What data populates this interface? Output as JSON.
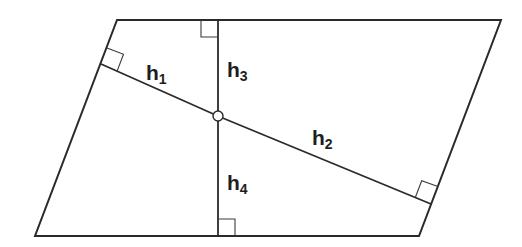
{
  "diagram": {
    "type": "geometry",
    "shape": "parallelogram",
    "vertices": {
      "top_left": [
        117,
        20
      ],
      "top_right": [
        501,
        20
      ],
      "bottom_right": [
        419,
        236
      ],
      "bottom_left": [
        35,
        236
      ]
    },
    "interior_point": {
      "x": 218,
      "y": 116,
      "radius": 5
    },
    "segments": [
      {
        "id": "h1",
        "label_main": "h",
        "label_sub": "1",
        "from": [
          218,
          116
        ],
        "to": [
          101,
          64
        ],
        "side": "left"
      },
      {
        "id": "h2",
        "label_main": "h",
        "label_sub": "2",
        "from": [
          218,
          116
        ],
        "to": [
          431,
          204
        ],
        "side": "right"
      },
      {
        "id": "h3",
        "label_main": "h",
        "label_sub": "3",
        "from": [
          218,
          116
        ],
        "to": [
          218,
          20
        ],
        "side": "top"
      },
      {
        "id": "h4",
        "label_main": "h",
        "label_sub": "4",
        "from": [
          218,
          116
        ],
        "to": [
          218,
          236
        ],
        "side": "bottom"
      }
    ],
    "labels": {
      "h1": {
        "main": "h",
        "sub": "1"
      },
      "h2": {
        "main": "h",
        "sub": "2"
      },
      "h3": {
        "main": "h",
        "sub": "3"
      },
      "h4": {
        "main": "h",
        "sub": "4"
      }
    },
    "colors": {
      "stroke": "#2a2a2a",
      "background": "#ffffff",
      "text": "#1e1e1e"
    }
  }
}
